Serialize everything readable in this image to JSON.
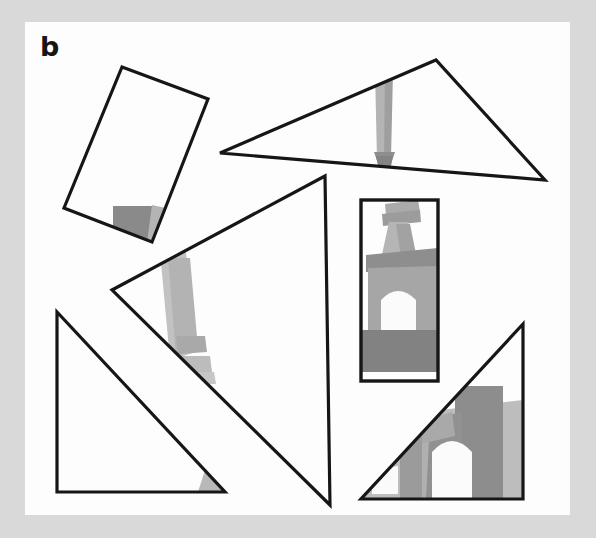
{
  "figure": {
    "panel_label": "b",
    "caption_text": "",
    "background_color": "#d9d9d9",
    "panel_color": "#fdfdfd",
    "outline_color": "#161616",
    "panel_rect": {
      "x": 25,
      "y": 22,
      "width": 545,
      "height": 493
    },
    "underlying_image": {
      "name": "eiffel-tower-photograph",
      "description": "Faint grayscale Eiffel Tower photograph visible only where the outlined shapes overlap it",
      "tones": {
        "light_gray": "#b9b9b9",
        "mid_gray": "#a5a5a5",
        "dark_gray": "#838383",
        "darker_gray": "#7a7a7a",
        "highlight": "#f2f2f2"
      }
    },
    "shapes": [
      {
        "id": "rotated-rectangle-top-left",
        "type": "rectangle",
        "rotation_deg": -20,
        "points": "122,67 208,99 152,242 64,208",
        "fill": "none",
        "stroke": "#161616",
        "stroke_width": 3.2,
        "content": "dark gray square and pale gray wedge fragment"
      },
      {
        "id": "triangle-top-right",
        "type": "triangle",
        "points": "220,153 436,60 545,180",
        "fill": "none",
        "stroke": "#161616",
        "stroke_width": 3.2,
        "content": "vertical gray arrow / tower column pointing down"
      },
      {
        "id": "triangle-center-large",
        "type": "triangle",
        "points": "325,176 112,290 330,505",
        "fill": "none",
        "stroke": "#161616",
        "stroke_width": 3.2,
        "content": "pale gray tower leg near left vertex"
      },
      {
        "id": "rectangle-middle-right",
        "type": "rectangle",
        "points": "361,200 438,200 438,381 361,381",
        "fill": "none",
        "stroke": "#161616",
        "stroke_width": 3.4,
        "content": "Eiffel Tower midsection with arch and dark gray band"
      },
      {
        "id": "triangle-bottom-left",
        "type": "triangle",
        "points": "57,312 57,492 225,492",
        "fill": "none",
        "stroke": "#161616",
        "stroke_width": 3.2,
        "content": "small gray sliver at bottom-right corner"
      },
      {
        "id": "triangle-bottom-right",
        "type": "triangle",
        "points": "523,324 523,499 361,499",
        "fill": "none",
        "stroke": "#161616",
        "stroke_width": 3.2,
        "content": "Eiffel Tower base arch and pillars in gray tones"
      }
    ]
  }
}
